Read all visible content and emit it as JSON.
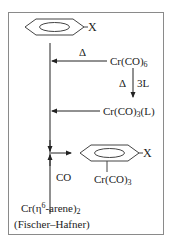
{
  "diagram": {
    "substituent_label": "X",
    "reagents": {
      "cr_co6": {
        "base": "Cr(CO)",
        "sub": "6"
      },
      "cr_co3_l": {
        "base": "Cr(CO)",
        "sub": "3",
        "tail": "(L)"
      },
      "cr_arene2": {
        "base": "Cr(η",
        "sup": "6",
        "mid": "-arene)",
        "sub": "2"
      },
      "fischer_hafner": "(Fischer–Hafner)"
    },
    "conditions": {
      "heat_top": "Δ",
      "heat_side": "Δ",
      "ligand": "3L",
      "co": "CO"
    },
    "product": {
      "x_label": "X",
      "metal_fragment": {
        "base": "Cr(CO)",
        "sub": "3"
      }
    },
    "colors": {
      "line": "#222222",
      "frame": "#8a8a8a",
      "background": "#ffffff"
    }
  }
}
